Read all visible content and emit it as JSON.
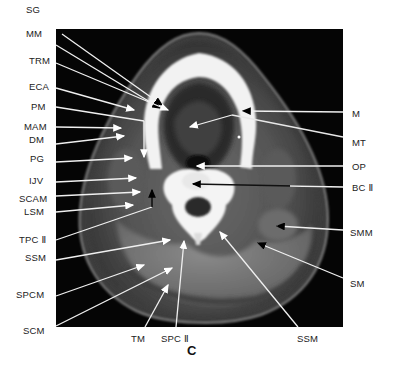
{
  "figure": {
    "panel_letter": "C",
    "colors": {
      "background": "#ffffff",
      "scan_background": "#050505",
      "label_text": "#222222",
      "pointer_line": "#f0f0f0"
    }
  },
  "labels_left": [
    {
      "id": "SG",
      "text": "SG",
      "x": 26,
      "y": 10
    },
    {
      "id": "MM",
      "text": "MM",
      "x": 6,
      "y": 34
    },
    {
      "id": "TRM",
      "text": "TRM",
      "x": 6,
      "y": 57
    },
    {
      "id": "ECA",
      "text": "ECA",
      "x": 6,
      "y": 83
    },
    {
      "id": "PM",
      "text": "PM",
      "x": 6,
      "y": 103
    },
    {
      "id": "MAM",
      "text": "MAM",
      "x": 6,
      "y": 123
    },
    {
      "id": "DM",
      "text": "DM",
      "x": 6,
      "y": 136
    },
    {
      "id": "PG",
      "text": "PG",
      "x": 6,
      "y": 155
    },
    {
      "id": "IJV",
      "text": "IJV",
      "x": 6,
      "y": 177
    },
    {
      "id": "SCAM",
      "text": "SCAM",
      "x": 6,
      "y": 195
    },
    {
      "id": "LSM",
      "text": "LSM",
      "x": 6,
      "y": 208
    },
    {
      "id": "TPC2",
      "text": "TPC Ⅱ",
      "x": 6,
      "y": 236
    },
    {
      "id": "SSM_L",
      "text": "SSM",
      "x": 6,
      "y": 254
    },
    {
      "id": "SPCM",
      "text": "SPCM",
      "x": 6,
      "y": 291
    },
    {
      "id": "SCM",
      "text": "SCM",
      "x": 6,
      "y": 327
    }
  ],
  "labels_right": [
    {
      "id": "M",
      "text": "M",
      "x": 352,
      "y": 110
    },
    {
      "id": "MT",
      "text": "MT",
      "x": 352,
      "y": 139
    },
    {
      "id": "OP",
      "text": "OP",
      "x": 352,
      "y": 163
    },
    {
      "id": "BC2",
      "text": "BC Ⅱ",
      "x": 352,
      "y": 184
    },
    {
      "id": "SMM",
      "text": "SMM",
      "x": 350,
      "y": 229
    },
    {
      "id": "SM",
      "text": "SM",
      "x": 350,
      "y": 280
    }
  ],
  "labels_bottom": [
    {
      "id": "TM",
      "text": "TM",
      "x": 131,
      "y": 334
    },
    {
      "id": "SPC2",
      "text": "SPC Ⅱ",
      "x": 162,
      "y": 334
    },
    {
      "id": "SSM_B",
      "text": "SSM",
      "x": 297,
      "y": 334
    }
  ],
  "pointers": [
    {
      "label": "SG",
      "from": [
        62,
        34
      ],
      "to": [
        162,
        105
      ],
      "head": "black"
    },
    {
      "label": "MM",
      "from": [
        56,
        45
      ],
      "to": [
        160,
        108
      ],
      "head": "black"
    },
    {
      "label": "TRM",
      "from": [
        56,
        63
      ],
      "to": [
        168,
        110
      ],
      "head": "white"
    },
    {
      "label": "ECA",
      "from": [
        56,
        88
      ],
      "to": [
        134,
        110
      ],
      "head": "white"
    },
    {
      "label": "PM",
      "from": [
        56,
        107
      ],
      "to": [
        144,
        121
      ],
      "head": "none"
    },
    {
      "label": "MAM",
      "from": [
        56,
        127
      ],
      "to": [
        121,
        128
      ],
      "head": "white"
    },
    {
      "label": "DM",
      "from": [
        56,
        144
      ],
      "to": [
        124,
        136
      ],
      "head": "white"
    },
    {
      "label": "ECA_v",
      "from": [
        144,
        121
      ],
      "to": [
        144,
        157
      ],
      "head": "white"
    },
    {
      "label": "PG",
      "from": [
        56,
        162
      ],
      "to": [
        132,
        158
      ],
      "head": "white"
    },
    {
      "label": "IJV",
      "from": [
        56,
        182
      ],
      "to": [
        136,
        178
      ],
      "head": "white"
    },
    {
      "label": "SCAM",
      "from": [
        56,
        196
      ],
      "to": [
        140,
        192
      ],
      "head": "white"
    },
    {
      "label": "LSM",
      "from": [
        56,
        212
      ],
      "to": [
        133,
        205
      ],
      "head": "white"
    },
    {
      "label": "TPC2",
      "from": [
        56,
        240
      ],
      "to": [
        152,
        207
      ],
      "head": "none"
    },
    {
      "label": "TPC2_v",
      "from": [
        152,
        207
      ],
      "to": [
        152,
        190
      ],
      "head": "black"
    },
    {
      "label": "SSM_L",
      "from": [
        56,
        260
      ],
      "to": [
        170,
        240
      ],
      "head": "white"
    },
    {
      "label": "SPCM",
      "from": [
        56,
        296
      ],
      "to": [
        144,
        265
      ],
      "head": "white"
    },
    {
      "label": "SCM",
      "from": [
        56,
        326
      ],
      "to": [
        172,
        268
      ],
      "head": "white"
    },
    {
      "label": "TM",
      "from": [
        145,
        327
      ],
      "to": [
        168,
        285
      ],
      "head": "white"
    },
    {
      "label": "SPC2",
      "from": [
        176,
        327
      ],
      "to": [
        184,
        241
      ],
      "head": "white"
    },
    {
      "label": "SSM_B",
      "from": [
        298,
        327
      ],
      "to": [
        220,
        232
      ],
      "head": "white"
    },
    {
      "label": "M",
      "from": [
        343,
        112
      ],
      "to": [
        243,
        111
      ],
      "head": "black"
    },
    {
      "label": "MT",
      "from": [
        343,
        137
      ],
      "to": [
        232,
        115
      ],
      "head": "black"
    },
    {
      "label": "MT_w",
      "from": [
        232,
        115
      ],
      "to": [
        190,
        127
      ],
      "head": "white"
    },
    {
      "label": "OP",
      "from": [
        343,
        166
      ],
      "to": [
        197,
        166
      ],
      "head": "white"
    },
    {
      "label": "BC2",
      "from": [
        343,
        187
      ],
      "to": [
        193,
        184
      ],
      "head": "black"
    },
    {
      "label": "SMM",
      "from": [
        343,
        230
      ],
      "to": [
        277,
        226
      ],
      "head": "black"
    },
    {
      "label": "SM",
      "from": [
        343,
        278
      ],
      "to": [
        258,
        243
      ],
      "head": "black"
    }
  ]
}
